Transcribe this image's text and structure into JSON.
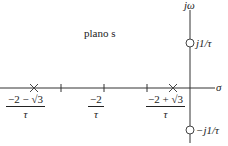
{
  "title": "plano s",
  "axes": {
    "horizontal_label": "σ",
    "vertical_label": "jω"
  },
  "zeros": [
    {
      "label": "j1/τ"
    },
    {
      "label": "−j1/τ"
    }
  ],
  "poles": [
    {
      "label_num": "−2 − √3",
      "label_den": "τ"
    },
    {
      "label_num": "−2 + √3",
      "label_den": "τ"
    }
  ],
  "tick_center": {
    "label_num": "−2",
    "label_den": "τ"
  }
}
